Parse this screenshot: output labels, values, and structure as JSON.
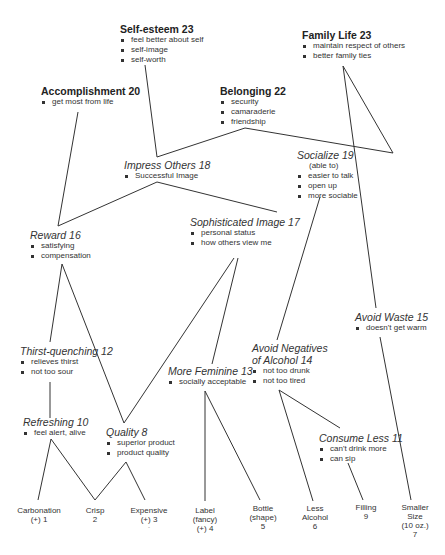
{
  "diagram": {
    "type": "hierarchical value map",
    "values": [
      {
        "id": "self_esteem",
        "title": "Self-esteem 23",
        "bullets": [
          "feel better about self",
          "self-image",
          "self-worth"
        ]
      },
      {
        "id": "family_life",
        "title": "Family Life 23",
        "bullets": [
          "maintain respect of others",
          "better family ties"
        ]
      },
      {
        "id": "accomplishment",
        "title": "Accomplishment 20",
        "bullets": [
          "get most from life"
        ]
      },
      {
        "id": "belonging",
        "title": "Belonging 22",
        "bullets": [
          "security",
          "camaraderie",
          "friendship"
        ]
      }
    ],
    "consequences": [
      {
        "id": "impress_others",
        "title": "Impress Others 18",
        "bullets": [
          "Successful Image"
        ]
      },
      {
        "id": "socialize",
        "title": "Socialize 19",
        "subtitle": "(able to)",
        "bullets": [
          "easier to talk",
          "open up",
          "more sociable"
        ]
      },
      {
        "id": "sophisticated_image",
        "title": "Sophisticated Image 17",
        "bullets": [
          "personal status",
          "how others view me"
        ]
      },
      {
        "id": "reward",
        "title": "Reward 16",
        "bullets": [
          "satisfying",
          "compensation"
        ]
      },
      {
        "id": "avoid_waste",
        "title": "Avoid Waste 15",
        "bullets": [
          "doesn't get warm"
        ]
      },
      {
        "id": "avoid_negatives",
        "title_line1": "Avoid Negatives",
        "title_line2": "of Alcohol 14",
        "bullets": [
          "not too drunk",
          "not too tired"
        ]
      },
      {
        "id": "more_feminine",
        "title": "More Feminine 13",
        "bullets": [
          "socially acceptable"
        ]
      },
      {
        "id": "thirst_quenching",
        "title": "Thirst-quenching 12",
        "bullets": [
          "relieves thirst",
          "not too sour"
        ]
      },
      {
        "id": "consume_less",
        "title": "Consume Less 11",
        "bullets": [
          "can't drink more",
          "can sip"
        ]
      },
      {
        "id": "refreshing",
        "title": "Refreshing 10",
        "bullets": [
          "feel alert, alive"
        ]
      },
      {
        "id": "quality",
        "title": "Quality 8",
        "bullets": [
          "superior product",
          "product quality"
        ]
      }
    ],
    "attributes": [
      {
        "id": "carbonation",
        "lines": [
          "Carbonation",
          "(+) 1"
        ]
      },
      {
        "id": "crisp",
        "lines": [
          "Crisp",
          "2"
        ]
      },
      {
        "id": "expensive",
        "lines": [
          "Expensive",
          "(+) 3",
          "-"
        ]
      },
      {
        "id": "label",
        "lines": [
          "Label",
          "(fancy)",
          "(+) 4"
        ]
      },
      {
        "id": "bottle",
        "lines": [
          "Bottle",
          "(shape)",
          "5"
        ]
      },
      {
        "id": "less_alcohol",
        "lines": [
          "Less",
          "Alcohol",
          "6"
        ]
      },
      {
        "id": "filling",
        "lines": [
          "Filling",
          "9"
        ]
      },
      {
        "id": "smaller_size",
        "lines": [
          "Smaller",
          "Size",
          "(10 oz.)",
          "7"
        ]
      }
    ],
    "links": [
      [
        "self_esteem",
        "impress_others"
      ],
      [
        "belonging",
        "impress_others"
      ],
      [
        "belonging",
        "socialize"
      ],
      [
        "family_life",
        "socialize"
      ],
      [
        "family_life",
        "avoid_waste"
      ],
      [
        "accomplishment",
        "reward"
      ],
      [
        "impress_others",
        "reward"
      ],
      [
        "impress_others",
        "sophisticated_image"
      ],
      [
        "reward",
        "thirst_quenching"
      ],
      [
        "reward",
        "quality"
      ],
      [
        "sophisticated_image",
        "quality"
      ],
      [
        "sophisticated_image",
        "more_feminine"
      ],
      [
        "socialize",
        "avoid_negatives"
      ],
      [
        "thirst_quenching",
        "refreshing"
      ],
      [
        "refreshing",
        "carbonation"
      ],
      [
        "refreshing",
        "crisp"
      ],
      [
        "quality",
        "crisp"
      ],
      [
        "quality",
        "expensive"
      ],
      [
        "more_feminine",
        "label"
      ],
      [
        "more_feminine",
        "bottle"
      ],
      [
        "avoid_negatives",
        "less_alcohol"
      ],
      [
        "avoid_negatives",
        "consume_less"
      ],
      [
        "consume_less",
        "filling"
      ],
      [
        "avoid_waste",
        "smaller_size"
      ]
    ]
  }
}
